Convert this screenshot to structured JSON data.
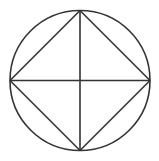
{
  "diagram": {
    "stroke_color": "#333333",
    "background": "#ffffff",
    "circle": {
      "cx": 80,
      "cy": 80.5,
      "r": 70
    },
    "vertices": {
      "top": [
        80,
        10.5
      ],
      "right": [
        150,
        80.5
      ],
      "bottom": [
        80,
        150.5
      ],
      "left": [
        10,
        80.5
      ]
    },
    "segments": [
      {
        "name": "top-right",
        "from": "top",
        "to": "right"
      },
      {
        "name": "right-bottom",
        "from": "right",
        "to": "bottom"
      },
      {
        "name": "bottom-left",
        "from": "bottom",
        "to": "left"
      },
      {
        "name": "left-top",
        "from": "left",
        "to": "top"
      },
      {
        "name": "vertical-diameter",
        "from": "top",
        "to": "bottom"
      },
      {
        "name": "horizontal-diameter",
        "from": "left",
        "to": "right"
      }
    ]
  }
}
